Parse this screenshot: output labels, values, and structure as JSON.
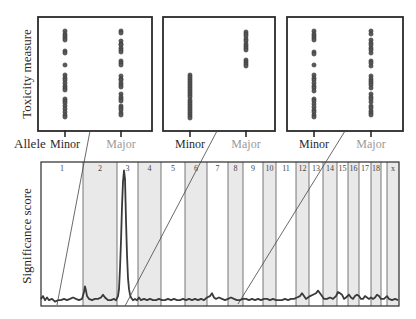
{
  "labels": {
    "toxicity_axis": "Toxicity measure",
    "significance_axis": "Significance score",
    "allele": "Allele",
    "minor": "Minor",
    "major": "Major"
  },
  "colors": {
    "frame": "#2a2a2a",
    "shaded_band": "#e9e9e9",
    "chrom_divider": "#555555",
    "signal": "#3a3a3a",
    "dot_fill": "#5a5a5a",
    "dot_stroke": "#333333",
    "minor_label": "#2a2a2a",
    "major_label": "#9a9a9a",
    "connector": "#444444"
  },
  "chart_data": [
    {
      "type": "scatter",
      "title": "Inset 1 (locus on chromosome 1)",
      "xlabel": "Allele",
      "ylabel": "Toxicity measure",
      "categories": [
        "Minor",
        "Major"
      ],
      "ylim": [
        0,
        100
      ],
      "grid": false,
      "box": [
        38,
        17,
        152,
        131
      ],
      "category_x": [
        65,
        121
      ],
      "series": [
        {
          "name": "Minor",
          "values": [
            95,
            92,
            90,
            88,
            86,
            75,
            73,
            61,
            51,
            48,
            46,
            43,
            40,
            38,
            36,
            27,
            25,
            23,
            20,
            17,
            14,
            11,
            9
          ]
        },
        {
          "name": "Major",
          "values": [
            95,
            93,
            85,
            82,
            81,
            78,
            76,
            74,
            65,
            63,
            61,
            50,
            47,
            46,
            43,
            41,
            39,
            32,
            29,
            27,
            25,
            20,
            18,
            16,
            13,
            11
          ]
        }
      ],
      "connector": {
        "from": [
          90,
          131
        ],
        "to": [
          57,
          305
        ]
      }
    },
    {
      "type": "scatter",
      "title": "Inset 2 (locus on chromosome 3 peak)",
      "xlabel": "Allele",
      "ylabel": "Toxicity measure",
      "categories": [
        "Minor",
        "Major"
      ],
      "ylim": [
        0,
        100
      ],
      "grid": false,
      "box": [
        163,
        17,
        275,
        131
      ],
      "category_x": [
        190,
        246
      ],
      "series": [
        {
          "name": "Minor",
          "values": [
            51,
            49,
            47,
            45,
            43,
            41,
            39,
            37,
            35,
            33,
            31,
            29,
            26,
            24,
            22,
            20,
            18,
            16,
            14,
            12,
            10,
            8
          ]
        },
        {
          "name": "Major",
          "values": [
            94,
            92,
            90,
            87,
            85,
            82,
            80,
            78,
            76,
            66,
            64,
            62,
            60
          ]
        }
      ],
      "connector": {
        "from": [
          217,
          131
        ],
        "to": [
          125,
          306
        ]
      }
    },
    {
      "type": "scatter",
      "title": "Inset 3 (locus on chromosome 8)",
      "xlabel": "Allele",
      "ylabel": "Toxicity measure",
      "categories": [
        "Minor",
        "Major"
      ],
      "ylim": [
        0,
        100
      ],
      "grid": false,
      "box": [
        287,
        17,
        403,
        131
      ],
      "category_x": [
        314,
        371
      ],
      "series": [
        {
          "name": "Minor",
          "values": [
            95,
            92,
            90,
            88,
            86,
            74,
            72,
            61,
            51,
            48,
            46,
            43,
            40,
            38,
            35,
            27,
            25,
            22,
            19,
            16,
            14,
            11,
            9
          ]
        },
        {
          "name": "Major",
          "values": [
            95,
            92,
            86,
            83,
            81,
            78,
            76,
            73,
            65,
            63,
            60,
            50,
            47,
            45,
            43,
            41,
            38,
            32,
            29,
            27,
            24,
            20,
            18,
            15,
            13,
            11
          ]
        }
      ],
      "connector": {
        "from": [
          345,
          131
        ],
        "to": [
          238,
          304
        ]
      }
    },
    {
      "type": "line",
      "title": "Genome-wide significance (Manhattan-style)",
      "xlabel": "Chromosome",
      "ylabel": "Significance score",
      "ylim": [
        0,
        100
      ],
      "grid": false,
      "box": [
        41,
        162,
        399,
        306
      ],
      "chromosomes": [
        {
          "label": "1",
          "start": 41,
          "shaded": false
        },
        {
          "label": "2",
          "start": 83,
          "shaded": true
        },
        {
          "label": "3",
          "start": 117,
          "shaded": false
        },
        {
          "label": "4",
          "start": 138,
          "shaded": true
        },
        {
          "label": "5",
          "start": 161,
          "shaded": false
        },
        {
          "label": "6",
          "start": 185,
          "shaded": true
        },
        {
          "label": "7",
          "start": 207,
          "shaded": false
        },
        {
          "label": "8",
          "start": 228,
          "shaded": true
        },
        {
          "label": "9",
          "start": 243,
          "shaded": false
        },
        {
          "label": "10",
          "start": 263,
          "shaded": true
        },
        {
          "label": "11",
          "start": 276,
          "shaded": false
        },
        {
          "label": "12",
          "start": 296,
          "shaded": true
        },
        {
          "label": "13",
          "start": 309,
          "shaded": false
        },
        {
          "label": "14",
          "start": 323,
          "shaded": true
        },
        {
          "label": "15",
          "start": 337,
          "shaded": false
        },
        {
          "label": "16",
          "start": 348,
          "shaded": true
        },
        {
          "label": "17",
          "start": 359,
          "shaded": false
        },
        {
          "label": "18",
          "start": 371,
          "shaded": true
        },
        {
          "label": "",
          "start": 381,
          "shaded": false
        },
        {
          "label": "x",
          "start": 387,
          "shaded": true
        }
      ],
      "x_end": 399,
      "x": [
        41,
        43,
        45,
        47,
        49,
        52,
        55,
        58,
        61,
        64,
        67,
        70,
        73,
        76,
        79,
        82,
        84,
        85,
        86,
        87,
        89,
        92,
        95,
        98,
        101,
        103,
        105,
        108,
        111,
        114,
        116,
        118,
        119,
        120,
        121,
        122,
        123,
        124,
        125,
        126,
        127,
        128,
        129,
        130,
        131,
        133,
        135,
        137,
        139,
        141,
        144,
        147,
        150,
        153,
        156,
        159,
        162,
        165,
        168,
        171,
        174,
        177,
        180,
        183,
        186,
        189,
        192,
        195,
        198,
        201,
        204,
        207,
        210,
        212,
        214,
        216,
        219,
        222,
        225,
        228,
        231,
        234,
        237,
        240,
        243,
        246,
        249,
        252,
        255,
        258,
        261,
        264,
        267,
        270,
        273,
        276,
        279,
        282,
        285,
        288,
        291,
        294,
        297,
        300,
        302,
        304,
        306,
        308,
        310,
        313,
        316,
        318,
        320,
        322,
        324,
        327,
        330,
        333,
        336,
        338,
        340,
        342,
        344,
        346,
        349,
        351,
        353,
        355,
        357,
        359,
        361,
        363,
        365,
        367,
        369,
        371,
        373,
        375,
        377,
        379,
        381,
        384,
        387,
        389,
        392,
        395,
        398
      ],
      "values": [
        3,
        5,
        2,
        4,
        2,
        3,
        1,
        2,
        2,
        3,
        2,
        3,
        4,
        3,
        2,
        3,
        8,
        12,
        9,
        5,
        3,
        2,
        3,
        3,
        4,
        6,
        4,
        2,
        2,
        3,
        2,
        5,
        10,
        25,
        45,
        70,
        88,
        96,
        90,
        60,
        35,
        18,
        10,
        6,
        4,
        2,
        3,
        2,
        4,
        2,
        3,
        2,
        3,
        2,
        2,
        3,
        2,
        2,
        3,
        2,
        3,
        2,
        2,
        3,
        2,
        3,
        2,
        3,
        2,
        3,
        2,
        4,
        5,
        7,
        4,
        3,
        4,
        3,
        2,
        3,
        4,
        3,
        2,
        2,
        3,
        3,
        2,
        3,
        2,
        3,
        2,
        3,
        3,
        2,
        3,
        2,
        2,
        2,
        3,
        2,
        3,
        3,
        4,
        5,
        7,
        5,
        3,
        4,
        5,
        6,
        7,
        9,
        7,
        5,
        3,
        3,
        4,
        3,
        5,
        8,
        7,
        6,
        3,
        4,
        6,
        4,
        3,
        5,
        6,
        5,
        3,
        3,
        5,
        4,
        3,
        4,
        3,
        4,
        6,
        5,
        3,
        3,
        5,
        3,
        2,
        3,
        2
      ]
    }
  ]
}
